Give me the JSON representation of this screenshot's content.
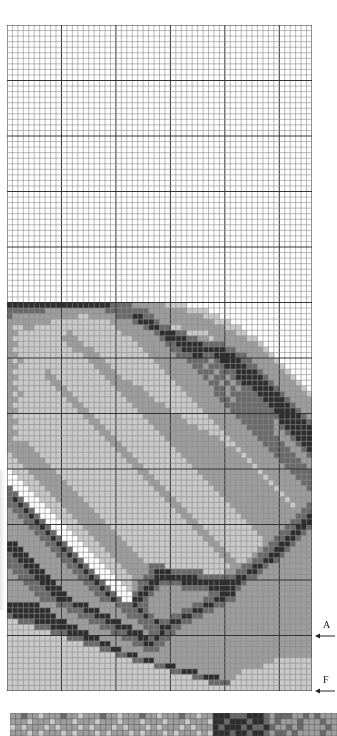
{
  "chart": {
    "type": "stitch-pattern-grid",
    "columns": 56,
    "rows": 120,
    "major_every": 10,
    "cell_width": 5.446,
    "cell_height": 5.55,
    "colors": {
      "line_minor": "#8a8a8a",
      "line_major": "#333333",
      "shades": [
        "#ffffff",
        "#c9c9c9",
        "#9d9d9d",
        "#6a6a6a",
        "#2e2e2e"
      ]
    },
    "image_start_row": 50,
    "shade_rows": [
      "44444444444444444443333222222111100000000000000000000000",
      "33333332222222222233333333222222211110000000000000000000",
      "32222222222221122222333443322222222211100000000000000000",
      "22222222111111111112222344432222222222111000000000000000",
      "21122111111111111111222223443311222222221110000000000000",
      "22111111111211111111122222234443311112222211000000000000",
      "21111111112221111111111222223444433221222222110000000000",
      "22111111111222111111111122222334444433332222221000000000",
      "21111111111122221111111112222233444444443322222100000000",
      "22111111111111222111111111222223334433444433222210000000",
      "21211111111111122211111111122222233332344443322221000000",
      "22111111111111112221111111112222223323334444332222100000",
      "21111112111111111222111111111222222333233344443222210000",
      "22111112211111111122211111111122222232332344444322221000",
      "21111111221111111112222111111112222223323234444432222100",
      "22111111122111111111222221111111222222332323344443222210",
      "21211111112211111111122222111111122222332333334444322221",
      "22111111111221111111112222211111112222233233333444432222",
      "21111111111122111111111222222111111222223333333344443222",
      "22111111111112211111111122222211111122222333333334444322",
      "21111111111111221111111112222222111112222233333333444432",
      "22111111111111122111111111222222211111222223333332444443",
      "21111111111111112211111111122222222111122222333332344444",
      "22111111111111111221111111112222222221112222233332234444",
      "21111111111111111122111111111222222222211222223333223444",
      "22221111111111111112211111111122222222221122222333322344",
      "22222111111111111111221111111112222222222212222233332234",
      "12222211111111111111122111111111222222222221222223333223",
      "11222221111111111111112211111111122222222222122222333322",
      "11122222111111111111111221111111112222222222212222233332",
      "01112222211111111111111122111111111222222222221222223333",
      "00111222221111111111111112211111111122222222222122222333",
      "00011122222111111111111111221111111112222222222212222233",
      "30001112222211111111111111122111111111222222222221222223",
      "33000111222221111111111111112211111111122222222222122222",
      "34300011122222111111111111111221111111112222222222212222",
      "33430001112222211111111111111122111111111222222222221223",
      "23343000111222221111111111111112211111111122222222222233",
      "22334300011122222111111111111111221111111112222222222334",
      "22233430001112222211111111111111122111111111222222223344",
      "22223343000111222221111111111111112211111111122222233443",
      "22222334300011122222111111111111111221111111112222334432",
      "22222233430001112222211111111111111122111111111223344322",
      "44222223343000111222221111111111111112211111111233443222",
      "44422222334300011122222111111111111111221111112334432222",
      "34442222233430001112222211111111111111122111123344322222",
      "33444222223343000111222221111111111111112211233443222222",
      "33344422222334300011122222333111111111111223344322222222",
      "23334442222233430001112222344433333311112233443222222222",
      "22333444222223343000111223344444444333333344332222222222",
      "22233344422222334300011233443333444444444443222222222222",
      "22223334442222233430001234432222333334444432222222222222",
      "22222333444222223343000344322222222223344422222222222222",
      "22222233344422222334300443222222222233443322222222222222",
      "44444422233344422222333433222222223344332222222222222222",
      "44444444222333444222233343222222334433222222222222222222",
      "34444444422223334442223334322233443322222222222222222222",
      "11333444444222233344422233343344332222222222222222222222",
      "11111333444442222333444223334433222222222222222222222222",
      "11111111333444422223334442334332222222222222222222222222",
      "11111111111333444222233344343322222222222222222222222222",
      "11111111111111333442222334433222222222222222222222222222",
      "11111111111111111334422223332222222222222222222222222222",
      "11111111111111111111334422222222222222222222222222222222",
      "11111111111111111111111334422222222222222222222221111111",
      "11111111111111111111111111133442222222222222222111111111",
      "11111111111111111111111111111133444222222221111111111111",
      "11111111111111111111111111111111113344422211111111111111",
      "11111111111111111111111111111111111113333111111111111111",
      "11111111111111111111111111111111111111111111111111111111"
    ]
  },
  "markers": [
    {
      "label": "A",
      "row": 110
    },
    {
      "label": "F",
      "row": 120
    }
  ],
  "strip": {
    "rows": 4,
    "shade_rows": [
      "2232212223221222322122232212223221224443334443233322323222",
      "2221222122212221222122212221222122214434443443232223222322",
      "1212221212221212221212221212221212224344434334322323222232",
      "2221212221212221212221212221212221214443443443233232222322"
    ]
  }
}
